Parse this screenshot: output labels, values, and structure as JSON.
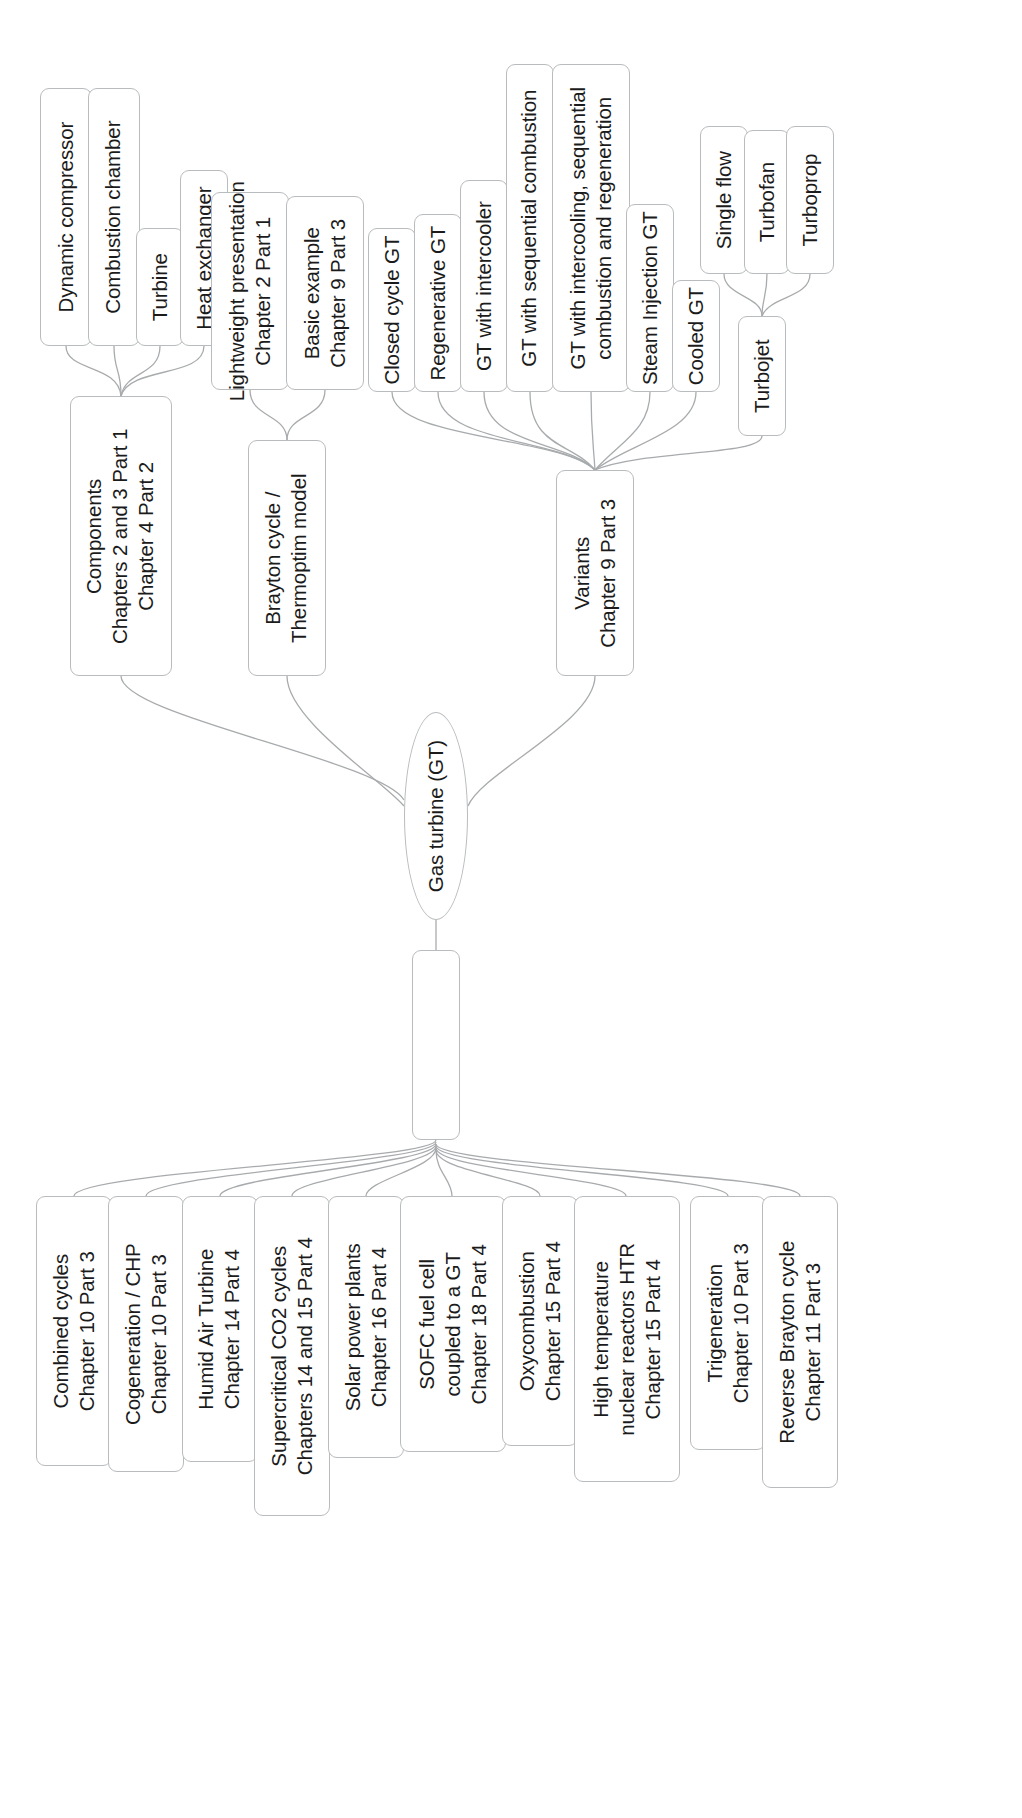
{
  "diagram": {
    "title": "Gas turbine (GT)",
    "orientation": "rotated-90-ccw",
    "root": {
      "label": "Gas turbine (GT)"
    },
    "branches": {
      "components": {
        "label_lines": [
          "Components",
          "Chapters 2 and 3 Part 1",
          "Chapter 4 Part 2"
        ],
        "children": [
          {
            "label_lines": [
              "Dynamic compressor"
            ]
          },
          {
            "label_lines": [
              "Combustion chamber"
            ]
          },
          {
            "label_lines": [
              "Turbine"
            ]
          },
          {
            "label_lines": [
              "Heat exchanger"
            ]
          }
        ]
      },
      "brayton": {
        "label_lines": [
          "Brayton cycle /",
          "Thermoptim model"
        ],
        "children": [
          {
            "label_lines": [
              "Lightweight presentation",
              "Chapter 2 Part 1"
            ]
          },
          {
            "label_lines": [
              "Basic example",
              "Chapter 9 Part 3"
            ]
          }
        ]
      },
      "variants": {
        "label_lines": [
          "Variants",
          "Chapter 9 Part 3"
        ],
        "children": [
          {
            "label_lines": [
              "Closed cycle GT"
            ]
          },
          {
            "label_lines": [
              "Regenerative GT"
            ]
          },
          {
            "label_lines": [
              "GT with intercooler"
            ]
          },
          {
            "label_lines": [
              "GT with sequential combustion"
            ]
          },
          {
            "label_lines": [
              "GT with intercooling, sequential",
              "combustion and regeneration"
            ]
          },
          {
            "label_lines": [
              "Steam Injection GT"
            ]
          },
          {
            "label_lines": [
              "Cooled GT"
            ]
          },
          {
            "label_lines": [
              "Turbojet"
            ]
          }
        ]
      },
      "turbojet": {
        "label_lines": [
          "Turbojet"
        ],
        "children": [
          {
            "label_lines": [
              "Single flow"
            ]
          },
          {
            "label_lines": [
              "Turbofan"
            ]
          },
          {
            "label_lines": [
              "Turboprop"
            ]
          }
        ]
      },
      "advanced": {
        "label_lines": [
          "Advanced cycles"
        ],
        "children": [
          {
            "label_lines": [
              "Combined cycles",
              "Chapter 10 Part 3"
            ]
          },
          {
            "label_lines": [
              "Cogeneration / CHP",
              "Chapter 10 Part 3"
            ]
          },
          {
            "label_lines": [
              "Humid Air Turbine",
              "Chapter 14 Part 4"
            ]
          },
          {
            "label_lines": [
              "Supercritical CO2 cycles",
              "Chapters 14 and 15 Part 4"
            ]
          },
          {
            "label_lines": [
              "Solar power plants",
              "Chapter 16 Part 4"
            ]
          },
          {
            "label_lines": [
              "SOFC fuel cell",
              "coupled to a GT",
              "Chapter 18 Part 4"
            ]
          },
          {
            "label_lines": [
              "Oxycombustion",
              "Chapter 15 Part 4"
            ]
          },
          {
            "label_lines": [
              "High temperature",
              "nuclear reactors HTR",
              "Chapter 15 Part 4"
            ]
          },
          {
            "label_lines": [
              "Trigeneration",
              "Chapter 10 Part 3"
            ]
          },
          {
            "label_lines": [
              "Reverse Brayton cycle",
              "Chapter 11 Part 3"
            ]
          }
        ]
      }
    },
    "colors": {
      "node_border": "#b9bcbe",
      "node_fill": "#ffffff",
      "edge": "#a8abad",
      "text": "#1b1b1b",
      "background": "#ffffff"
    },
    "nodes": [
      {
        "id": "n_dyncomp",
        "x": 40,
        "y": 88,
        "w": 52,
        "h": 258,
        "path": "branches.components.children.0.label_lines",
        "name": "node-dynamic-compressor"
      },
      {
        "id": "n_combch",
        "x": 88,
        "y": 88,
        "w": 52,
        "h": 258,
        "path": "branches.components.children.1.label_lines",
        "name": "node-combustion-chamber"
      },
      {
        "id": "n_turbine",
        "x": 136,
        "y": 228,
        "w": 48,
        "h": 118,
        "path": "branches.components.children.2.label_lines",
        "name": "node-turbine"
      },
      {
        "id": "n_hx",
        "x": 180,
        "y": 170,
        "w": 48,
        "h": 176,
        "path": "branches.components.children.3.label_lines",
        "name": "node-heat-exchanger"
      },
      {
        "id": "n_light",
        "x": 211,
        "y": 192,
        "w": 78,
        "h": 198,
        "path": "branches.brayton.children.0.label_lines",
        "name": "node-lightweight-presentation"
      },
      {
        "id": "n_basic",
        "x": 286,
        "y": 196,
        "w": 78,
        "h": 194,
        "path": "branches.brayton.children.1.label_lines",
        "name": "node-basic-example"
      },
      {
        "id": "n_closed",
        "x": 368,
        "y": 228,
        "w": 48,
        "h": 164,
        "path": "branches.variants.children.0.label_lines",
        "name": "node-closed-cycle-gt"
      },
      {
        "id": "n_regen",
        "x": 414,
        "y": 214,
        "w": 48,
        "h": 178,
        "path": "branches.variants.children.1.label_lines",
        "name": "node-regenerative-gt"
      },
      {
        "id": "n_intercool",
        "x": 460,
        "y": 180,
        "w": 48,
        "h": 212,
        "path": "branches.variants.children.2.label_lines",
        "name": "node-gt-with-intercooler"
      },
      {
        "id": "n_seqcomb",
        "x": 506,
        "y": 64,
        "w": 48,
        "h": 328,
        "path": "branches.variants.children.3.label_lines",
        "name": "node-gt-with-sequential-combustion"
      },
      {
        "id": "n_icsr",
        "x": 552,
        "y": 64,
        "w": 78,
        "h": 328,
        "path": "branches.variants.children.4.label_lines",
        "name": "node-gt-with-intercooling-sequential-combustion-regeneration"
      },
      {
        "id": "n_steam",
        "x": 626,
        "y": 204,
        "w": 48,
        "h": 188,
        "path": "branches.variants.children.5.label_lines",
        "name": "node-steam-injection-gt"
      },
      {
        "id": "n_cooled",
        "x": 672,
        "y": 280,
        "w": 48,
        "h": 112,
        "path": "branches.variants.children.6.label_lines",
        "name": "node-cooled-gt"
      },
      {
        "id": "n_single",
        "x": 700,
        "y": 126,
        "w": 48,
        "h": 148,
        "path": "branches.turbojet.children.0.label_lines",
        "name": "node-single-flow"
      },
      {
        "id": "n_fan",
        "x": 744,
        "y": 130,
        "w": 46,
        "h": 144,
        "path": "branches.turbojet.children.1.label_lines",
        "name": "node-turbofan"
      },
      {
        "id": "n_prop",
        "x": 786,
        "y": 126,
        "w": 48,
        "h": 148,
        "path": "branches.turbojet.children.2.label_lines",
        "name": "node-turboprop"
      },
      {
        "id": "n_turbojet",
        "x": 738,
        "y": 316,
        "w": 48,
        "h": 120,
        "path": "branches.turbojet.label_lines",
        "name": "node-turbojet"
      },
      {
        "id": "n_components",
        "x": 70,
        "y": 396,
        "w": 102,
        "h": 280,
        "path": "branches.components.label_lines",
        "name": "node-components"
      },
      {
        "id": "n_brayton",
        "x": 248,
        "y": 440,
        "w": 78,
        "h": 236,
        "path": "branches.brayton.label_lines",
        "name": "node-brayton-cycle"
      },
      {
        "id": "n_variants",
        "x": 556,
        "y": 470,
        "w": 78,
        "h": 206,
        "path": "branches.variants.label_lines",
        "name": "node-variants"
      },
      {
        "id": "n_root",
        "x": 404,
        "y": 712,
        "w": 64,
        "h": 208,
        "path": "root.label",
        "name": "node-root-gas-turbine",
        "root": true
      },
      {
        "id": "n_advanced",
        "x": 412,
        "y": 950,
        "w": 48,
        "h": 190,
        "path": "branches.advanced.label",
        "name": "node-advanced-cycles"
      },
      {
        "id": "a0",
        "x": 36,
        "y": 1196,
        "w": 76,
        "h": 270,
        "path": "branches.advanced.children.0.label_lines",
        "name": "node-combined-cycles"
      },
      {
        "id": "a1",
        "x": 108,
        "y": 1196,
        "w": 76,
        "h": 276,
        "path": "branches.advanced.children.1.label_lines",
        "name": "node-cogeneration-chp"
      },
      {
        "id": "a2",
        "x": 182,
        "y": 1196,
        "w": 76,
        "h": 266,
        "path": "branches.advanced.children.2.label_lines",
        "name": "node-humid-air-turbine"
      },
      {
        "id": "a3",
        "x": 254,
        "y": 1196,
        "w": 76,
        "h": 320,
        "path": "branches.advanced.children.3.label_lines",
        "name": "node-supercritical-co2-cycles"
      },
      {
        "id": "a4",
        "x": 328,
        "y": 1196,
        "w": 76,
        "h": 262,
        "path": "branches.advanced.children.4.label_lines",
        "name": "node-solar-power-plants"
      },
      {
        "id": "a5",
        "x": 400,
        "y": 1196,
        "w": 106,
        "h": 256,
        "path": "branches.advanced.children.5.label_lines",
        "name": "node-sofc-fuel-cell"
      },
      {
        "id": "a6",
        "x": 502,
        "y": 1196,
        "w": 76,
        "h": 250,
        "path": "branches.advanced.children.6.label_lines",
        "name": "node-oxycombustion"
      },
      {
        "id": "a7",
        "x": 574,
        "y": 1196,
        "w": 106,
        "h": 286,
        "path": "branches.advanced.children.7.label_lines",
        "name": "node-high-temperature-nuclear-reactors"
      },
      {
        "id": "a8",
        "x": 690,
        "y": 1196,
        "w": 76,
        "h": 254,
        "path": "branches.advanced.children.8.label_lines",
        "name": "node-trigeneration"
      },
      {
        "id": "a9",
        "x": 762,
        "y": 1196,
        "w": 76,
        "h": 292,
        "path": "branches.advanced.children.9.label_lines",
        "name": "node-reverse-brayton-cycle"
      }
    ],
    "edges": [
      "M66,346 C66,372 118,364 121,396",
      "M114,346 C114,372 121,368 121,396",
      "M160,346 C160,376 126,370 121,396",
      "M204,346 C204,378 130,366 121,396",
      "M250,390 C250,418 287,414 287,440",
      "M325,390 C325,418 287,414 287,440",
      "M392,392 C392,440 560,436 595,470",
      "M438,392 C438,444 562,438 595,470",
      "M484,392 C484,446 566,440 595,470",
      "M530,392 C530,448 572,442 595,470",
      "M591,392 C591,430 593,440 595,470",
      "M650,392 C650,430 620,442 595,470",
      "M696,392 C696,432 628,444 595,470",
      "M762,436 C762,456 640,450 595,470",
      "M724,274 C724,296 762,296 762,316",
      "M767,274 C767,296 762,300 762,316",
      "M810,274 C810,298 770,296 762,316",
      "M121,676 C121,716 380,760 404,800",
      "M287,676 C287,720 382,780 404,806",
      "M595,676 C595,722 482,772 468,806",
      "M436,920 C436,936 436,936 436,950",
      "M436,1140 C436,1160 74,1172 74,1196",
      "M436,1142 C436,1162 146,1174 146,1196",
      "M436,1144 C436,1164 220,1176 220,1196",
      "M436,1146 C436,1166 292,1178 292,1196",
      "M436,1148 C436,1168 366,1180 366,1196",
      "M436,1150 C436,1172 452,1180 452,1196",
      "M436,1150 C436,1172 540,1180 540,1196",
      "M436,1148 C436,1170 626,1178 626,1196",
      "M436,1146 C436,1168 728,1176 728,1196",
      "M436,1144 C436,1166 800,1174 800,1196"
    ]
  }
}
